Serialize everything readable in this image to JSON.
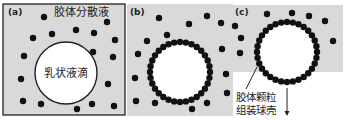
{
  "figure": {
    "background": "#ffffff",
    "panel_fill": "#d9d9d9",
    "dot_color": "#111111",
    "droplet_fill": "#ffffff",
    "stroke_color": "#222222"
  },
  "panels": [
    {
      "id": "a",
      "tag": "(a)",
      "title": "胶体分散液",
      "droplet_label": "乳状液滴",
      "rect": {
        "x": 3,
        "y": 4,
        "w": 122,
        "h": 111
      },
      "bordered": true,
      "droplet": {
        "cx": 66,
        "cy": 73,
        "r": 31
      },
      "shell": false,
      "free_dots": [
        [
          44,
          17
        ],
        [
          107,
          22
        ],
        [
          33,
          38
        ],
        [
          52,
          34
        ],
        [
          76,
          30
        ],
        [
          94,
          33
        ],
        [
          115,
          40
        ],
        [
          24,
          56
        ],
        [
          93,
          52
        ],
        [
          113,
          57
        ],
        [
          21,
          79
        ],
        [
          108,
          84
        ],
        [
          23,
          101
        ],
        [
          41,
          104
        ],
        [
          77,
          109
        ],
        [
          92,
          104
        ],
        [
          114,
          106
        ]
      ]
    },
    {
      "id": "b",
      "tag": "(b)",
      "rect": {
        "x": 127,
        "y": 4,
        "w": 106,
        "h": 112
      },
      "bordered": false,
      "droplet": {
        "cx": 180,
        "cy": 72,
        "r": 30
      },
      "shell": true,
      "shell_count": 32,
      "free_dots": [
        [
          159,
          18
        ],
        [
          189,
          24
        ],
        [
          207,
          16
        ],
        [
          221,
          23
        ],
        [
          167,
          35
        ],
        [
          147,
          41
        ],
        [
          222,
          49
        ],
        [
          138,
          54
        ],
        [
          135,
          78
        ],
        [
          136,
          101
        ],
        [
          155,
          103
        ],
        [
          192,
          109
        ],
        [
          207,
          103
        ],
        [
          226,
          74
        ],
        [
          227,
          93
        ]
      ]
    },
    {
      "id": "c",
      "tag": "(c)",
      "rect": {
        "x": 232,
        "y": 5,
        "w": 111,
        "h": 67
      },
      "bordered": false,
      "droplet": {
        "cx": 287,
        "cy": 52,
        "r": 30
      },
      "shell": true,
      "shell_count": 32,
      "free_dots": [
        [
          267,
          14
        ],
        [
          292,
          13
        ],
        [
          309,
          16
        ],
        [
          325,
          21
        ],
        [
          235,
          26
        ],
        [
          241,
          38
        ],
        [
          333,
          41
        ],
        [
          240,
          53
        ]
      ],
      "label_line1": "胶体颗粒",
      "label_line2": "组装球壳",
      "leader": {
        "x1": 257,
        "y1": 67,
        "x2": 246,
        "y2": 89
      },
      "arrow": {
        "x": 287,
        "y1": 88,
        "y2": 116
      }
    }
  ]
}
